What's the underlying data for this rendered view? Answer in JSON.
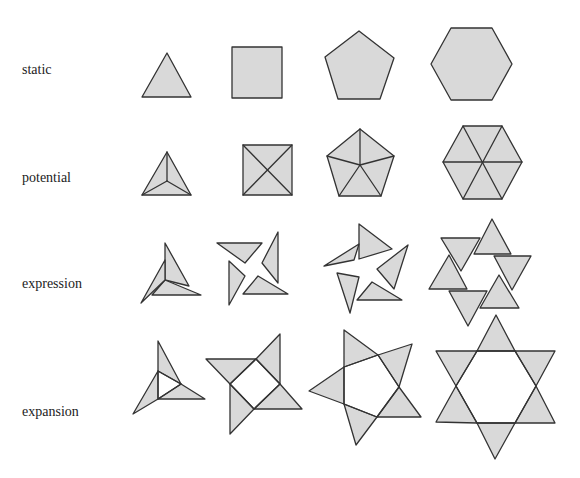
{
  "colors": {
    "fill": "#d9d9d9",
    "stroke": "#333333",
    "background": "#ffffff",
    "text": "#222222"
  },
  "rows": [
    {
      "label": "static",
      "label_pos": [
        22,
        62
      ]
    },
    {
      "label": "potential",
      "label_pos": [
        22,
        170
      ]
    },
    {
      "label": "expression",
      "label_pos": [
        22,
        276
      ]
    },
    {
      "label": "expansion",
      "label_pos": [
        22,
        404
      ]
    }
  ],
  "columns": [
    "triangle",
    "square",
    "pentagon",
    "hexagon"
  ],
  "shapes": [
    {
      "row": "static",
      "col": "triangle",
      "polygons": [
        [
          [
            167,
            53
          ],
          [
            142,
            97
          ],
          [
            191,
            97
          ]
        ]
      ],
      "lines": []
    },
    {
      "row": "static",
      "col": "square",
      "polygons": [
        [
          [
            232,
            47
          ],
          [
            282,
            47
          ],
          [
            282,
            98
          ],
          [
            232,
            98
          ]
        ]
      ],
      "lines": []
    },
    {
      "row": "static",
      "col": "pentagon",
      "polygons": [
        [
          [
            359,
            31
          ],
          [
            394,
            58
          ],
          [
            380,
            99
          ],
          [
            338,
            99
          ],
          [
            325,
            57
          ]
        ]
      ],
      "lines": []
    },
    {
      "row": "static",
      "col": "hexagon",
      "polygons": [
        [
          [
            451,
            28
          ],
          [
            492,
            28
          ],
          [
            512,
            64
          ],
          [
            492,
            100
          ],
          [
            451,
            100
          ],
          [
            431,
            64
          ]
        ]
      ],
      "lines": []
    },
    {
      "row": "potential",
      "col": "triangle",
      "polygons": [
        [
          [
            167,
            152
          ],
          [
            191,
            195
          ],
          [
            142,
            195
          ]
        ]
      ],
      "lines": [
        [
          [
            167,
            152
          ],
          [
            167,
            181
          ]
        ],
        [
          [
            142,
            195
          ],
          [
            167,
            181
          ]
        ],
        [
          [
            191,
            195
          ],
          [
            167,
            181
          ]
        ]
      ]
    },
    {
      "row": "potential",
      "col": "square",
      "polygons": [
        [
          [
            243,
            145
          ],
          [
            292,
            145
          ],
          [
            292,
            195
          ],
          [
            243,
            195
          ]
        ]
      ],
      "lines": [
        [
          [
            243,
            145
          ],
          [
            292,
            195
          ]
        ],
        [
          [
            292,
            145
          ],
          [
            243,
            195
          ]
        ]
      ]
    },
    {
      "row": "potential",
      "col": "pentagon",
      "polygons": [
        [
          [
            360,
            129
          ],
          [
            394,
            156
          ],
          [
            381,
            196
          ],
          [
            339,
            196
          ],
          [
            327,
            156
          ]
        ]
      ],
      "lines": [
        [
          [
            360,
            129
          ],
          [
            360,
            165
          ]
        ],
        [
          [
            394,
            156
          ],
          [
            360,
            165
          ]
        ],
        [
          [
            381,
            196
          ],
          [
            360,
            165
          ]
        ],
        [
          [
            339,
            196
          ],
          [
            360,
            165
          ]
        ],
        [
          [
            327,
            156
          ],
          [
            360,
            165
          ]
        ]
      ]
    },
    {
      "row": "potential",
      "col": "hexagon",
      "polygons": [
        [
          [
            463,
            126
          ],
          [
            502,
            126
          ],
          [
            522,
            162
          ],
          [
            502,
            199
          ],
          [
            463,
            199
          ],
          [
            443,
            162
          ]
        ]
      ],
      "lines": [
        [
          [
            463,
            126
          ],
          [
            502,
            199
          ]
        ],
        [
          [
            502,
            126
          ],
          [
            463,
            199
          ]
        ],
        [
          [
            443,
            162
          ],
          [
            522,
            162
          ]
        ]
      ]
    },
    {
      "row": "expression",
      "col": "triangle",
      "polygons": [
        [
          [
            165,
            243
          ],
          [
            189,
            286
          ],
          [
            165,
            280
          ]
        ],
        [
          [
            201,
            295
          ],
          [
            152,
            295
          ],
          [
            165,
            280
          ]
        ],
        [
          [
            141,
            303
          ],
          [
            165,
            260
          ],
          [
            165,
            280
          ]
        ]
      ],
      "lines": []
    },
    {
      "row": "expression",
      "col": "square",
      "polygons": [
        [
          [
            217,
            243
          ],
          [
            262,
            243
          ],
          [
            245,
            263
          ]
        ],
        [
          [
            278,
            232
          ],
          [
            278,
            283
          ],
          [
            262,
            263
          ]
        ],
        [
          [
            288,
            294
          ],
          [
            243,
            294
          ],
          [
            258,
            276
          ]
        ],
        [
          [
            229,
            305
          ],
          [
            229,
            261
          ],
          [
            245,
            276
          ]
        ]
      ],
      "lines": []
    },
    {
      "row": "expression",
      "col": "pentagon",
      "polygons": [
        [
          [
            359,
            224
          ],
          [
            392,
            249
          ],
          [
            359,
            259
          ]
        ],
        [
          [
            408,
            245
          ],
          [
            394,
            289
          ],
          [
            377,
            269
          ]
        ],
        [
          [
            402,
            300
          ],
          [
            357,
            300
          ],
          [
            372,
            282
          ]
        ],
        [
          [
            350,
            313
          ],
          [
            337,
            273
          ],
          [
            359,
            277
          ]
        ],
        [
          [
            324,
            266
          ],
          [
            359,
            244
          ],
          [
            354,
            260
          ]
        ]
      ],
      "lines": []
    },
    {
      "row": "expression",
      "col": "hexagon",
      "polygons": [
        [
          [
            492,
            219
          ],
          [
            511,
            254
          ],
          [
            474,
            254
          ]
        ],
        [
          [
            531,
            256
          ],
          [
            512,
            290
          ],
          [
            494,
            256
          ]
        ],
        [
          [
            519,
            308
          ],
          [
            480,
            308
          ],
          [
            499,
            275
          ]
        ],
        [
          [
            468,
            326
          ],
          [
            449,
            291
          ],
          [
            487,
            291
          ]
        ],
        [
          [
            429,
            289
          ],
          [
            449,
            255
          ],
          [
            467,
            289
          ]
        ],
        [
          [
            441,
            238
          ],
          [
            480,
            238
          ],
          [
            461,
            271
          ]
        ]
      ],
      "lines": []
    },
    {
      "row": "expansion",
      "col": "triangle",
      "polygons": [
        [
          [
            158,
            341
          ],
          [
            181,
            384
          ],
          [
            158,
            371
          ]
        ],
        [
          [
            205,
            399
          ],
          [
            158,
            399
          ],
          [
            181,
            384
          ]
        ],
        [
          [
            133,
            414
          ],
          [
            158,
            371
          ],
          [
            158,
            399
          ]
        ]
      ],
      "lines": [
        [
          [
            158,
            371
          ],
          [
            181,
            384
          ],
          [
            158,
            399
          ],
          [
            158,
            371
          ]
        ]
      ]
    },
    {
      "row": "expansion",
      "col": "square",
      "polygons": [
        [
          [
            206,
            359
          ],
          [
            256,
            359
          ],
          [
            230,
            384
          ]
        ],
        [
          [
            280,
            334
          ],
          [
            280,
            384
          ],
          [
            256,
            359
          ]
        ],
        [
          [
            302,
            409
          ],
          [
            254,
            409
          ],
          [
            280,
            384
          ]
        ],
        [
          [
            230,
            434
          ],
          [
            230,
            384
          ],
          [
            254,
            409
          ]
        ]
      ],
      "lines": [
        [
          [
            230,
            384
          ],
          [
            256,
            359
          ],
          [
            280,
            384
          ],
          [
            254,
            409
          ],
          [
            230,
            384
          ]
        ]
      ]
    },
    {
      "row": "expansion",
      "col": "pentagon",
      "polygons": [
        [
          [
            344,
            330
          ],
          [
            378,
            355
          ],
          [
            344,
            367
          ]
        ],
        [
          [
            412,
            344
          ],
          [
            399,
            387
          ],
          [
            378,
            355
          ]
        ],
        [
          [
            421,
            417
          ],
          [
            377,
            417
          ],
          [
            399,
            387
          ]
        ],
        [
          [
            356,
            445
          ],
          [
            344,
            404
          ],
          [
            377,
            417
          ]
        ],
        [
          [
            309,
            391
          ],
          [
            344,
            367
          ],
          [
            344,
            404
          ]
        ]
      ],
      "lines": [
        [
          [
            344,
            367
          ],
          [
            378,
            355
          ],
          [
            399,
            387
          ],
          [
            377,
            417
          ],
          [
            344,
            404
          ],
          [
            344,
            367
          ]
        ]
      ]
    },
    {
      "row": "expansion",
      "col": "hexagon",
      "polygons": [
        [
          [
            496,
            315
          ],
          [
            515,
            351
          ],
          [
            477,
            351
          ]
        ],
        [
          [
            555,
            351
          ],
          [
            536,
            386
          ],
          [
            515,
            351
          ]
        ],
        [
          [
            555,
            423
          ],
          [
            515,
            423
          ],
          [
            536,
            386
          ]
        ],
        [
          [
            495,
            459
          ],
          [
            477,
            423
          ],
          [
            515,
            423
          ]
        ],
        [
          [
            436,
            422
          ],
          [
            456,
            386
          ],
          [
            477,
            423
          ]
        ],
        [
          [
            436,
            351
          ],
          [
            477,
            351
          ],
          [
            456,
            386
          ]
        ]
      ],
      "lines": [
        [
          [
            477,
            351
          ],
          [
            515,
            351
          ],
          [
            536,
            386
          ],
          [
            515,
            423
          ],
          [
            477,
            423
          ],
          [
            456,
            386
          ],
          [
            477,
            351
          ]
        ]
      ]
    }
  ]
}
